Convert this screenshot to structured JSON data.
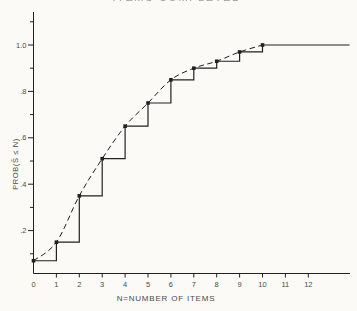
{
  "page": {
    "background_color": "#fbfaf7",
    "ink_color": "#222120",
    "label_color": "#4a4a4a",
    "clipped_title_text": "ITEMS COMPLETED"
  },
  "chart_data": {
    "type": "line",
    "title": "",
    "xlabel": "N=NUMBER OF ITEMS",
    "ylabel": "PROB(S̃ ≤ N)",
    "xlim": [
      0,
      13.8
    ],
    "ylim": [
      0,
      1.15
    ],
    "grid": false,
    "legend": "none",
    "x_tick_labels": [
      "0",
      "1",
      "2",
      "3",
      "4",
      "5",
      "6",
      "7",
      "8",
      "9",
      "10",
      "11",
      "12"
    ],
    "y_ticks": [
      {
        "label": ".2",
        "value": 0.2
      },
      {
        "label": ".4",
        "value": 0.4
      },
      {
        "label": ".6",
        "value": 0.6
      },
      {
        "label": ".8",
        "value": 0.8
      },
      {
        "label": "1.0",
        "value": 1.0
      }
    ],
    "y_minor_tick_values": [
      0.1,
      0.3,
      0.5,
      0.7,
      0.9,
      1.1
    ],
    "x": [
      0,
      1,
      2,
      3,
      4,
      5,
      6,
      7,
      8,
      9,
      10
    ],
    "series": [
      {
        "name": "empirical step function",
        "style": "step-post",
        "marker": "square",
        "values": [
          0.07,
          0.15,
          0.35,
          0.51,
          0.65,
          0.75,
          0.85,
          0.9,
          0.93,
          0.97,
          1.0
        ],
        "extend_flat_to_x": 13.8
      },
      {
        "name": "smooth cumulative curve",
        "style": "dashed-smooth",
        "marker": "none",
        "values": [
          0.07,
          0.15,
          0.35,
          0.51,
          0.65,
          0.75,
          0.85,
          0.9,
          0.93,
          0.97,
          1.0
        ]
      }
    ]
  }
}
